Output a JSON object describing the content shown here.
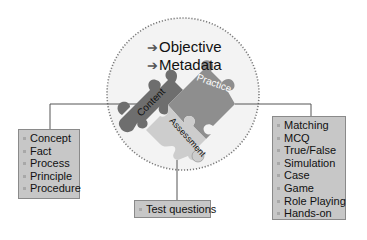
{
  "diagram": {
    "title_items": [
      {
        "icon": "arrow-right-icon",
        "label": "Objective"
      },
      {
        "icon": "arrow-right-icon",
        "label": "Metadata"
      }
    ],
    "pieces": [
      {
        "label": "Content",
        "color": "#6f6f6f"
      },
      {
        "label": "Practice",
        "color": "#8d8d8d"
      },
      {
        "label": "Assessment",
        "color": "#c9c9c9"
      }
    ],
    "content_box": {
      "items": [
        "Concept",
        "Fact",
        "Process",
        "Principle",
        "Procedure"
      ]
    },
    "practice_box": {
      "items": [
        "Matching",
        "MCQ",
        "True/False",
        "Simulation",
        "Case",
        "Game",
        "Role Playing",
        "Hands-on"
      ]
    },
    "assessment_box": {
      "items": [
        "Test questions"
      ]
    },
    "colors": {
      "circle_fill": "#f2f2f2",
      "circle_stroke": "#777777",
      "box_fill": "#c7c7c7",
      "box_border": "#8a8a8a",
      "connector": "#555555"
    }
  }
}
